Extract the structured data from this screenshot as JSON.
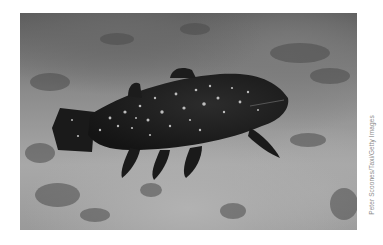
{
  "image": {
    "subject": "Coelacanth fish swimming over rocky seabed",
    "alt": "Dark coelacanth with white speckles swimming near the ocean floor",
    "palette": {
      "fish_body": "#1e1e1e",
      "fish_spots": "#d8d8d8",
      "seabed_light": "#b0b0b0",
      "water_dark": "#555555",
      "credit_text": "#8a8a8a"
    }
  },
  "credit": {
    "text": "Peter Scoones/Taxi/Getty Images"
  }
}
